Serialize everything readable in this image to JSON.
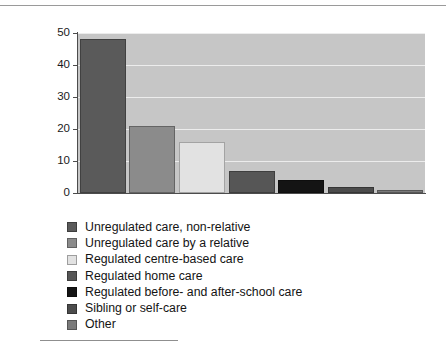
{
  "chart_data": {
    "type": "bar",
    "title": "",
    "subtitle": "",
    "xlabel": "",
    "ylabel": "",
    "ylim": [
      0,
      50
    ],
    "ytick_labels": [
      "50",
      "40",
      "30",
      "20",
      "10",
      "0"
    ],
    "ytick_values": [
      50,
      40,
      30,
      20,
      10,
      0
    ],
    "grid": true,
    "legend_position": "below",
    "categories": [
      "Unregulated care, non-relative",
      "Unregulated care by a relative",
      "Regulated centre-based care",
      "Regulated home care",
      "Regulated before- and after-school care",
      "Sibling or self-care",
      "Other"
    ],
    "values": [
      48,
      21,
      16,
      7,
      4,
      2,
      1
    ],
    "bar_colors": [
      "#5a5a5a",
      "#8b8b8b",
      "#e2e2e2",
      "#565656",
      "#141414",
      "#4c4c4c",
      "#7a7a7a"
    ],
    "plot_background": "#c6c6c6",
    "gridline_color": "#ececec",
    "axis_color": "#4c4c4c"
  },
  "legend": {
    "items": [
      {
        "label": "Unregulated care, non-relative",
        "color": "#5a5a5a"
      },
      {
        "label": "Unregulated care by a relative",
        "color": "#8b8b8b"
      },
      {
        "label": "Regulated centre-based care",
        "color": "#e2e2e2"
      },
      {
        "label": "Regulated home care",
        "color": "#565656"
      },
      {
        "label": "Regulated before- and after-school care",
        "color": "#141414"
      },
      {
        "label": "Sibling or self-care",
        "color": "#4c4c4c"
      },
      {
        "label": "Other",
        "color": "#7a7a7a"
      }
    ]
  }
}
